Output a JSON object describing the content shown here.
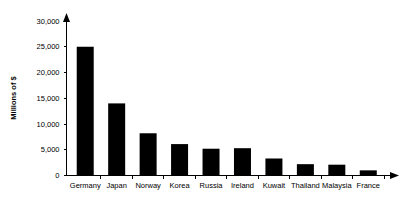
{
  "chart_data": {
    "type": "bar",
    "title": "",
    "subtitle": "",
    "xlabel": "",
    "ylabel": "Millions of $",
    "categories": [
      "Germany",
      "Japan",
      "Norway",
      "Korea",
      "Russia",
      "Ireland",
      "Kuwait",
      "Thailand",
      "Malaysia",
      "France"
    ],
    "values": [
      25000,
      14000,
      8200,
      6100,
      5200,
      5300,
      3300,
      2200,
      2100,
      1000
    ],
    "ylim": [
      0,
      30000
    ],
    "yticks": [
      0,
      5000,
      10000,
      15000,
      20000,
      25000,
      30000
    ],
    "ytick_labels": [
      "0",
      "5,000",
      "10,000",
      "15,000",
      "20,000",
      "25,000",
      "30,000"
    ],
    "grid": false,
    "legend": null,
    "legend_position": "none",
    "bar_color": "#000000",
    "axis_color": "#000000",
    "background_color": "#ffffff"
  }
}
